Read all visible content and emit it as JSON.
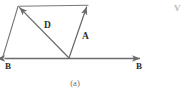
{
  "figure": {
    "caption": "(a)",
    "corner_mark": "V",
    "stroke_color": "#6b6b6b",
    "label_color": "#2e2e2e",
    "caption_color": "#6f6f6f",
    "background": "#ffffff",
    "labels": {
      "vector_d": "D",
      "vector_a": "A",
      "axis_left": "B",
      "axis_right": "B"
    },
    "geometry": {
      "axis": {
        "x1": 2,
        "y1": 58.5,
        "x2": 143,
        "y2": 58.5,
        "arrow_left": true,
        "arrow_right": true
      },
      "vector_d": {
        "x1": 69,
        "y1": 58,
        "x2": 18,
        "y2": 6,
        "arrow_head": "end"
      },
      "vector_a": {
        "x1": 69,
        "y1": 58,
        "x2": 88,
        "y2": 5,
        "arrow_head": "end"
      },
      "side_left": {
        "x1": 2,
        "y1": 58,
        "x2": 18,
        "y2": 6
      },
      "side_top": {
        "x1": 18,
        "y1": 6,
        "x2": 88,
        "y2": 5
      }
    }
  }
}
